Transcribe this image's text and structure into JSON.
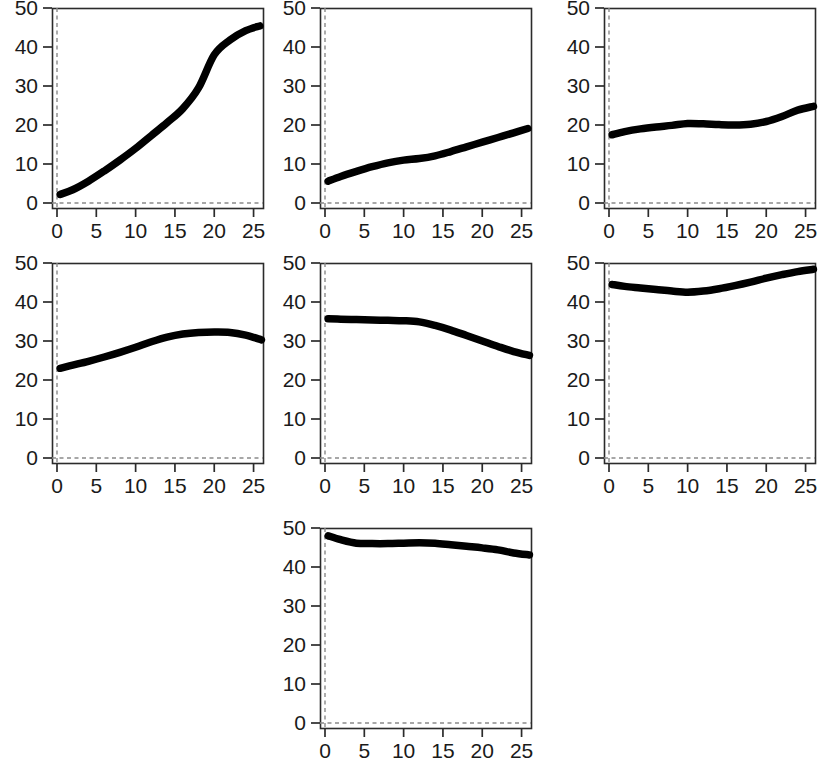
{
  "figure": {
    "background": "#ffffff",
    "curve_color": "#000000",
    "axis_color": "#2b2b2b",
    "guide_color": "#8a8a8a",
    "panel_count": 7,
    "layout": "3x3 grid, 3 panels in row 1, 3 panels in row 2, 1 centered panel in row 3"
  },
  "chart_data": [
    {
      "type": "line",
      "title": "",
      "xlabel": "",
      "ylabel": "",
      "xlim": [
        -0.8,
        27
      ],
      "ylim": [
        0,
        51
      ],
      "xticks": [
        0,
        5,
        10,
        15,
        20,
        25
      ],
      "yticks": [
        0,
        10,
        20,
        30,
        40,
        50
      ],
      "xticklabels": [
        "0",
        "5",
        "10",
        "15",
        "20",
        "25"
      ],
      "yticklabels": [
        "0",
        "10",
        "20",
        "30",
        "40",
        "50"
      ],
      "grid": false,
      "legend": "none",
      "annotations": [
        "dashed vertical reference line at x=0",
        "dashed horizontal reference line at y=0"
      ],
      "x": [
        0.4,
        2,
        4,
        6,
        8,
        10,
        12,
        14,
        16,
        18,
        20,
        22,
        24,
        25.8
      ],
      "y": [
        2.2,
        3.4,
        5.6,
        8.2,
        11.0,
        14.0,
        17.3,
        20.6,
        24.2,
        29.5,
        38.0,
        41.8,
        44.2,
        45.4
      ]
    },
    {
      "type": "line",
      "title": "",
      "xlabel": "",
      "ylabel": "",
      "xlim": [
        -0.8,
        27
      ],
      "ylim": [
        0,
        51
      ],
      "xticks": [
        0,
        5,
        10,
        15,
        20,
        25
      ],
      "yticks": [
        0,
        10,
        20,
        30,
        40,
        50
      ],
      "xticklabels": [
        "0",
        "5",
        "10",
        "15",
        "20",
        "25"
      ],
      "yticklabels": [
        "0",
        "10",
        "20",
        "30",
        "40",
        "50"
      ],
      "grid": false,
      "legend": "none",
      "annotations": [
        "dashed vertical reference line at x=0",
        "dashed horizontal reference line at y=0"
      ],
      "x": [
        0.4,
        2,
        4,
        6,
        8,
        10,
        12,
        14,
        16,
        18,
        20,
        22,
        24,
        25.8
      ],
      "y": [
        5.6,
        6.8,
        8.1,
        9.3,
        10.3,
        11.0,
        11.4,
        12.1,
        13.2,
        14.4,
        15.6,
        16.8,
        18.0,
        19.1
      ]
    },
    {
      "type": "line",
      "title": "",
      "xlabel": "",
      "ylabel": "",
      "xlim": [
        -0.8,
        27
      ],
      "ylim": [
        0,
        51
      ],
      "xticks": [
        0,
        5,
        10,
        15,
        20,
        25
      ],
      "yticks": [
        0,
        10,
        20,
        30,
        40,
        50
      ],
      "xticklabels": [
        "0",
        "5",
        "10",
        "15",
        "20",
        "25"
      ],
      "yticklabels": [
        "0",
        "10",
        "20",
        "30",
        "40",
        "50"
      ],
      "grid": false,
      "legend": "none",
      "annotations": [
        "dashed vertical reference line at x=0",
        "dashed horizontal reference line at y=0"
      ],
      "x": [
        0.4,
        2,
        4,
        6,
        8,
        10,
        12,
        14,
        16,
        18,
        20,
        22,
        24,
        26
      ],
      "y": [
        17.5,
        18.3,
        19.0,
        19.5,
        19.9,
        20.4,
        20.3,
        20.1,
        20.0,
        20.2,
        20.9,
        22.2,
        23.8,
        24.8
      ]
    },
    {
      "type": "line",
      "title": "",
      "xlabel": "",
      "ylabel": "",
      "xlim": [
        -0.8,
        27
      ],
      "ylim": [
        0,
        51
      ],
      "xticks": [
        0,
        5,
        10,
        15,
        20,
        25
      ],
      "yticks": [
        0,
        10,
        20,
        30,
        40,
        50
      ],
      "xticklabels": [
        "0",
        "5",
        "10",
        "15",
        "20",
        "25"
      ],
      "yticklabels": [
        "0",
        "10",
        "20",
        "30",
        "40",
        "50"
      ],
      "grid": false,
      "legend": "none",
      "annotations": [
        "dashed vertical reference line at x=0",
        "dashed horizontal reference line at y=0"
      ],
      "x": [
        0.4,
        2,
        4,
        6,
        8,
        10,
        12,
        14,
        16,
        18,
        20,
        22,
        24,
        26
      ],
      "y": [
        23.0,
        23.8,
        24.8,
        25.9,
        27.1,
        28.4,
        29.8,
        31.0,
        31.8,
        32.2,
        32.3,
        32.2,
        31.5,
        30.3
      ]
    },
    {
      "type": "line",
      "title": "",
      "xlabel": "",
      "ylabel": "",
      "xlim": [
        -0.8,
        27
      ],
      "ylim": [
        0,
        51
      ],
      "xticks": [
        0,
        5,
        10,
        15,
        20,
        25
      ],
      "yticks": [
        0,
        10,
        20,
        30,
        40,
        50
      ],
      "xticklabels": [
        "0",
        "5",
        "10",
        "15",
        "20",
        "25"
      ],
      "yticklabels": [
        "0",
        "10",
        "20",
        "30",
        "40",
        "50"
      ],
      "grid": false,
      "legend": "none",
      "annotations": [
        "dashed vertical reference line at x=0",
        "dashed horizontal reference line at y=0"
      ],
      "x": [
        0.4,
        2,
        4,
        6,
        8,
        10,
        12,
        14,
        16,
        18,
        20,
        22,
        24,
        26
      ],
      "y": [
        35.7,
        35.6,
        35.5,
        35.4,
        35.3,
        35.2,
        34.9,
        34.0,
        32.8,
        31.4,
        30.0,
        28.6,
        27.3,
        26.3
      ]
    },
    {
      "type": "line",
      "title": "",
      "xlabel": "",
      "ylabel": "",
      "xlim": [
        -0.8,
        27
      ],
      "ylim": [
        0,
        51
      ],
      "xticks": [
        0,
        5,
        10,
        15,
        20,
        25
      ],
      "yticks": [
        0,
        10,
        20,
        30,
        40,
        50
      ],
      "xticklabels": [
        "0",
        "5",
        "10",
        "15",
        "20",
        "25"
      ],
      "yticklabels": [
        "0",
        "10",
        "20",
        "30",
        "40",
        "50"
      ],
      "grid": false,
      "legend": "none",
      "annotations": [
        "dashed vertical reference line at x=0",
        "dashed horizontal reference line at y=0"
      ],
      "x": [
        0.4,
        2,
        4,
        6,
        8,
        10,
        12,
        14,
        16,
        18,
        20,
        22,
        24,
        26
      ],
      "y": [
        44.5,
        44.0,
        43.6,
        43.2,
        42.8,
        42.5,
        42.8,
        43.4,
        44.2,
        45.1,
        46.1,
        47.0,
        47.8,
        48.4
      ]
    },
    {
      "type": "line",
      "title": "",
      "xlabel": "",
      "ylabel": "",
      "xlim": [
        -0.8,
        27
      ],
      "ylim": [
        0,
        51
      ],
      "xticks": [
        0,
        5,
        10,
        15,
        20,
        25
      ],
      "yticks": [
        0,
        10,
        20,
        30,
        40,
        50
      ],
      "xticklabels": [
        "0",
        "5",
        "10",
        "15",
        "20",
        "25"
      ],
      "yticklabels": [
        "0",
        "10",
        "20",
        "30",
        "40",
        "50"
      ],
      "grid": false,
      "legend": "none",
      "annotations": [
        "dashed vertical reference line at x=0",
        "dashed horizontal reference line at y=0"
      ],
      "x": [
        0.4,
        2,
        4,
        6,
        8,
        10,
        12,
        14,
        16,
        18,
        20,
        22,
        24,
        26
      ],
      "y": [
        48.0,
        47.0,
        46.1,
        46.0,
        46.0,
        46.1,
        46.2,
        46.1,
        45.7,
        45.3,
        44.9,
        44.4,
        43.6,
        43.1
      ]
    }
  ],
  "panels": [
    {
      "id": "panel-1",
      "row": 1,
      "col": 1
    },
    {
      "id": "panel-2",
      "row": 1,
      "col": 2
    },
    {
      "id": "panel-3",
      "row": 1,
      "col": 3
    },
    {
      "id": "panel-4",
      "row": 2,
      "col": 1
    },
    {
      "id": "panel-5",
      "row": 2,
      "col": 2
    },
    {
      "id": "panel-6",
      "row": 2,
      "col": 3
    },
    {
      "id": "panel-7",
      "row": 3,
      "col": 2
    }
  ]
}
